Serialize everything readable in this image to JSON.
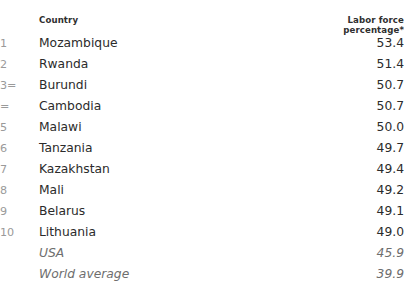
{
  "table": {
    "headers": {
      "rank": "",
      "country": "Country",
      "value": "Labor force percentage*"
    },
    "rows": [
      {
        "rank": "1",
        "country": "Mozambique",
        "value": "53.4"
      },
      {
        "rank": "2",
        "country": "Rwanda",
        "value": "51.4"
      },
      {
        "rank": "3=",
        "country": "Burundi",
        "value": "50.7"
      },
      {
        "rank": "=",
        "country": "Cambodia",
        "value": "50.7"
      },
      {
        "rank": "5",
        "country": "Malawi",
        "value": "50.0"
      },
      {
        "rank": "6",
        "country": "Tanzania",
        "value": "49.7"
      },
      {
        "rank": "7",
        "country": "Kazakhstan",
        "value": "49.4"
      },
      {
        "rank": "8",
        "country": "Mali",
        "value": "49.2"
      },
      {
        "rank": "9",
        "country": "Belarus",
        "value": "49.1"
      },
      {
        "rank": "10",
        "country": "Lithuania",
        "value": "49.0"
      }
    ],
    "reference_rows": [
      {
        "rank": "",
        "country": "USA",
        "value": "45.9"
      },
      {
        "rank": "",
        "country": "World average",
        "value": "39.9"
      }
    ]
  },
  "colors": {
    "background": "#ffffff",
    "text_primary": "#2b2b2b",
    "text_header": "#2f2f2f",
    "text_rank": "#9a9a9a",
    "text_reference": "#6e6e6e"
  }
}
